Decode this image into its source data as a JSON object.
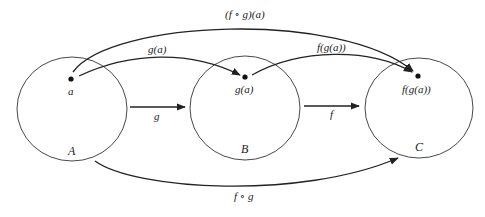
{
  "diagram": {
    "type": "function composition mapping diagram",
    "colors": {
      "stroke": "#222222",
      "background": "#ffffff"
    },
    "sets": [
      {
        "id": "A",
        "label": "A",
        "element_label": "a"
      },
      {
        "id": "B",
        "label": "B",
        "element_label": "g(a)"
      },
      {
        "id": "C",
        "label": "C",
        "element_label": "f(g(a))"
      }
    ],
    "arrows": [
      {
        "id": "set-g",
        "from": "A",
        "to": "B",
        "label": "g"
      },
      {
        "id": "set-f",
        "from": "B",
        "to": "C",
        "label": "f"
      },
      {
        "id": "set-fog",
        "from": "A",
        "to": "C",
        "label": "f ∘ g"
      },
      {
        "id": "elem-ga",
        "from": "a",
        "to": "g(a)",
        "label": "g(a)"
      },
      {
        "id": "elem-fga",
        "from": "g(a)",
        "to": "f(g(a))",
        "label": "f(g(a))"
      },
      {
        "id": "elem-fog-a",
        "from": "a",
        "to": "f(g(a))",
        "label": "(f ∘ g)(a)"
      }
    ]
  }
}
